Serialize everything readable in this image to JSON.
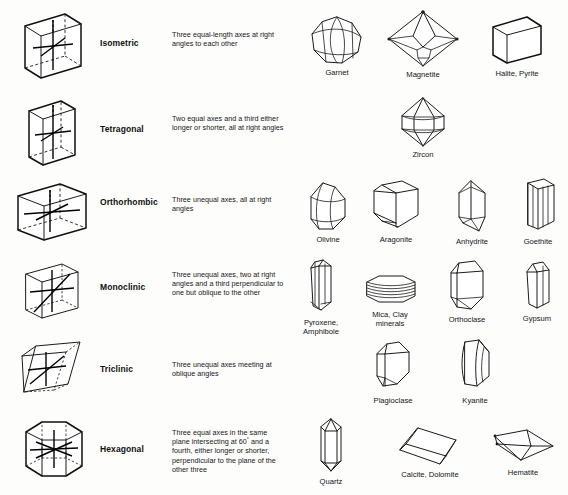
{
  "figure": {
    "background_color": "#fdfdfc",
    "ink_color": "#1b1b1b"
  },
  "systems": [
    {
      "name": "Isometric",
      "description": "Three equal-length axes at right angles to each other",
      "axis_diagram": "isometric-cube-axes",
      "minerals": [
        {
          "label": "Garnet",
          "shape": "dodecahedron"
        },
        {
          "label": "Magnetite",
          "shape": "octahedron"
        },
        {
          "label": "Halite, Pyrite",
          "shape": "cube"
        }
      ]
    },
    {
      "name": "Tetragonal",
      "description": "Two equal axes and a third either longer or shorter, all at right angles",
      "axis_diagram": "tetragonal-prism-axes",
      "minerals": [
        {
          "label": "Zircon",
          "shape": "dipyramid"
        }
      ]
    },
    {
      "name": "Orthorhombic",
      "description": "Three unequal axes, all at right angles",
      "axis_diagram": "orthorhombic-box-axes",
      "minerals": [
        {
          "label": "Olivine",
          "shape": "olivine-blocky"
        },
        {
          "label": "Aragonite",
          "shape": "aragonite-prism"
        },
        {
          "label": "Anhydrite",
          "shape": "anhydrite-prism"
        },
        {
          "label": "Goethite",
          "shape": "goethite-striated-prism"
        }
      ]
    },
    {
      "name": "Monoclinic",
      "description": "Three unequal axes, two at right angles and a third perpendicular to one but oblique to the other",
      "axis_diagram": "monoclinic-box-axes",
      "minerals": [
        {
          "label": "Pyroxene,\nAmphibole",
          "shape": "pyroxene-prism"
        },
        {
          "label": "Mica, Clay\nminerals",
          "shape": "mica-plates"
        },
        {
          "label": "Orthoclase",
          "shape": "orthoclase-prism"
        },
        {
          "label": "Gypsum",
          "shape": "gypsum-prism"
        }
      ]
    },
    {
      "name": "Triclinic",
      "description": "Three unequal axes meeting at oblique angles",
      "axis_diagram": "triclinic-rhomb-axes",
      "minerals": [
        {
          "label": "Plagioclase",
          "shape": "plagioclase-block"
        },
        {
          "label": "Kyanite",
          "shape": "kyanite-blade"
        }
      ]
    },
    {
      "name": "Hexagonal",
      "description_parts": {
        "before": "Three equal axes in the same plane intersecting at 60",
        "degree": "°",
        "after": " and a fourth, either longer or shorter, perpendicular to the plane of the other three"
      },
      "description": "Three equal axes in the same plane intersecting at 60° and a fourth, either longer or shorter, perpendicular to the plane of the other three",
      "axis_diagram": "hexagonal-prism-axes",
      "minerals": [
        {
          "label": "Quartz",
          "shape": "quartz-prism"
        },
        {
          "label": "Calcite, Dolomite",
          "shape": "rhombohedron"
        },
        {
          "label": "Hematite",
          "shape": "hematite-rhomb"
        }
      ]
    }
  ]
}
